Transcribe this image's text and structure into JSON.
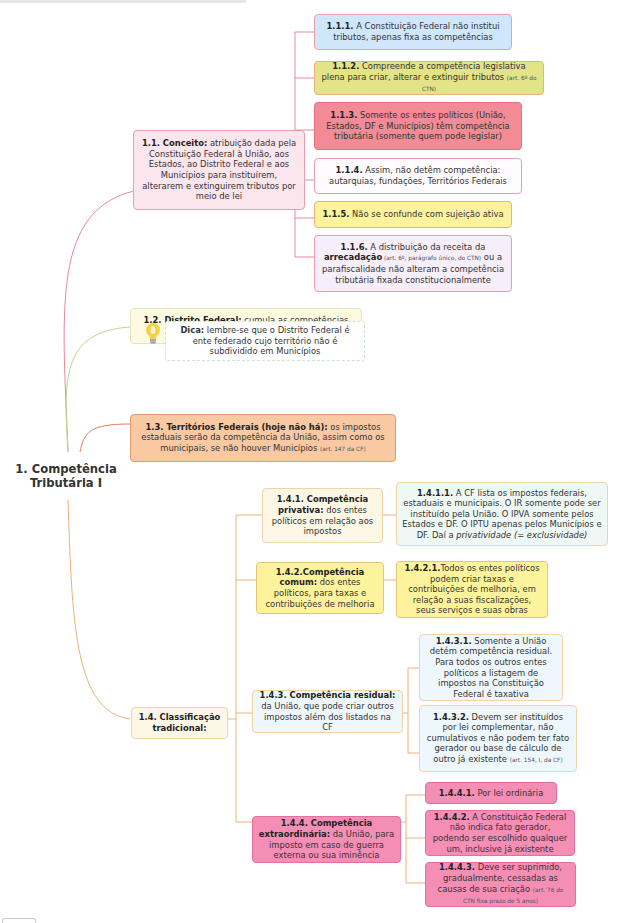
{
  "root": {
    "line1": "1. Competência",
    "line2": "Tributária I"
  },
  "colors": {
    "conceito_branch": "#e58a9a",
    "df_branch": "#b8d98a",
    "territorios_branch": "#d9845a",
    "classificacao_branch": "#e8b27a",
    "blue": "#cfe6fb",
    "olive": "#e3e388",
    "red": "#f28b95",
    "white": "#fdfbfd",
    "yellow": "#fdf39c",
    "lavender": "#f6eef8",
    "pink_light": "#fbe6ee",
    "cream": "#fcfae0",
    "peach": "#f8c9a3",
    "light_cream": "#fdf7e6",
    "teal_light": "#eef8f4",
    "pale_blue": "#eef7fb",
    "hot_pink": "#f58eb5"
  },
  "nodes": {
    "n1_1": {
      "bold": "1.1. Conceito:",
      "text": " atribuição dada pela Constituição Federal à União, aos Estados, ao Distrito Federal e aos Municípios para instituírem, alterarem e extinguirem tributos por meio de lei"
    },
    "n1_1_1": {
      "bold": "1.1.1.",
      "text": " A Constituição Federal não institui tributos, apenas fixa as competências"
    },
    "n1_1_2": {
      "bold": "1.1.2.",
      "text": " Compreende a competência legislativa plena para criar, alterar e extinguir tributos ",
      "ref": "(art. 6º do CTN)"
    },
    "n1_1_3": {
      "bold": "1.1.3.",
      "text": " Somente os entes políticos (União, Estados, DF e Municípios) têm competência tributária (somente quem pode legislar)"
    },
    "n1_1_4": {
      "bold": "1.1.4.",
      "text": " Assim, não detêm competência: autarquias, fundações, Territórios Federais"
    },
    "n1_1_5": {
      "bold": "1.1.5.",
      "text": " Não se confunde com sujeição ativa"
    },
    "n1_1_6": {
      "bold": "1.1.6.",
      "text": " A distribuição da receita da ",
      "bold2": "arrecadação",
      "ref": " (art. 6º, parágrafo único, do CTN)",
      "text2": " ou a parafiscalidade não alteram a competência tributária fixada constitucionalmente"
    },
    "n1_2": {
      "bold": "1.2. Distrito Federal:",
      "text": " cumula as competências estaduais e municipais ",
      "ref": "(art. 147 da CF)"
    },
    "tip": {
      "bold": "Dica:",
      "text": " lembre-se que o Distrito Federal é ente federado cujo território não é subdividido em Municípios"
    },
    "n1_3": {
      "bold": "1.3. Territórios Federais (hoje não há):",
      "text": " os impostos estaduais serão da competência da União, assim como os municipais, se não houver Municípios ",
      "ref": "(art. 147 da CF)"
    },
    "n1_4": {
      "bold": "1.4. Classificação tradicional:"
    },
    "n1_4_1": {
      "bold": "1.4.1. Competência privativa:",
      "text": " dos entes políticos em relação aos impostos"
    },
    "n1_4_1_1": {
      "bold": "1.4.1.1.",
      "text": " A CF lista os impostos federais, estaduais e municipais. O IR somente pode ser instituído pela União. O IPVA somente pelos Estados e DF. O IPTU apenas pelos Municípios e DF. Daí a ",
      "italic": "privatividade (= exclusividade)"
    },
    "n1_4_2": {
      "bold": "1.4.2.Competência comum:",
      "text": " dos entes políticos, para taxas e contribuições de melhoria"
    },
    "n1_4_2_1": {
      "bold": "1.4.2.1.",
      "text": "Todos os entes políticos podem criar taxas e contribuições de melhoria, em relação a suas fiscalizações, seus serviços e suas obras"
    },
    "n1_4_3": {
      "bold": "1.4.3. Competência residual:",
      "text": " da União, que pode criar outros impostos além dos listados na CF"
    },
    "n1_4_3_1": {
      "bold": "1.4.3.1.",
      "text": " Somente a União detém competência residual. Para todos os outros entes políticos a listagem de impostos na Constituição Federal é taxativa"
    },
    "n1_4_3_2": {
      "bold": "1.4.3.2.",
      "text": " Devem ser instituídos por lei complementar, não cumulativos e não podem ter fato gerador ou base de cálculo de outro já existente ",
      "ref": "(art. 154, I, da CF)"
    },
    "n1_4_4": {
      "bold": "1.4.4. Competência extraordinária:",
      "text": " da União, para imposto em caso de guerra externa ou sua iminência"
    },
    "n1_4_4_1": {
      "bold": "1.4.4.1.",
      "text": " Por lei ordinária"
    },
    "n1_4_4_2": {
      "bold": "1.4.4.2.",
      "text": " A Constituição Federal não indica fato gerador, podendo ser escolhido qualquer um, inclusive já existente"
    },
    "n1_4_4_3": {
      "bold": "1.4.4.3.",
      "text": " Deve ser suprimido, gradualmente, cessadas as causas de sua criação ",
      "ref": "(art. 76 do CTN fixa prazo de 5 anos)"
    }
  },
  "icons": {
    "tip_icon": "lightbulb-icon"
  }
}
